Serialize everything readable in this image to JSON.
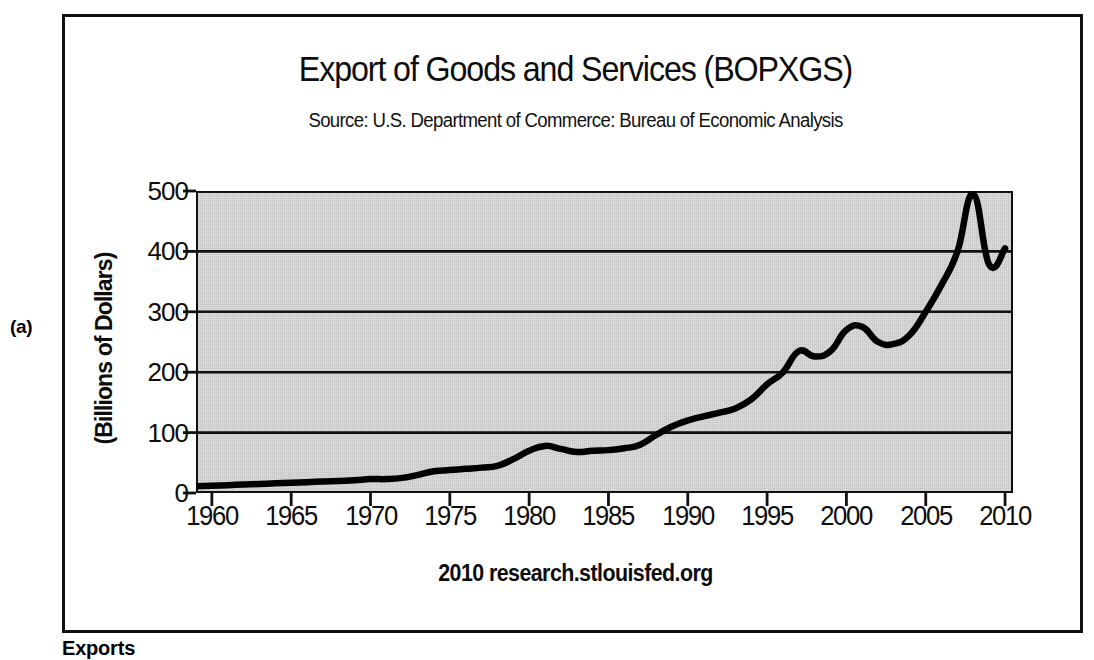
{
  "figure": {
    "panel_label": "(a)",
    "caption": "Exports"
  },
  "chart_data": {
    "type": "line",
    "title": "Export of Goods and Services (BOPXGS)",
    "subtitle": "Source: U.S. Department of Commerce: Bureau of Economic Analysis",
    "footer": "2010 research.stlouisfed.org",
    "xlabel": "",
    "ylabel": "(Billions of Dollars)",
    "xlim": [
      1959,
      2010.5
    ],
    "ylim": [
      0,
      500
    ],
    "xticks": [
      1960,
      1965,
      1970,
      1975,
      1980,
      1985,
      1990,
      1995,
      2000,
      2005,
      2010
    ],
    "yticks": [
      0,
      100,
      200,
      300,
      400,
      500
    ],
    "grid": "horizontal",
    "legend": "none",
    "plot_background": "#dedede",
    "line_color": "#000000",
    "series": [
      {
        "name": "Export of Goods and Services (BOPXGS)",
        "x": [
          1959,
          1960,
          1961,
          1962,
          1963,
          1964,
          1965,
          1966,
          1967,
          1968,
          1969,
          1970,
          1971,
          1972,
          1973,
          1974,
          1975,
          1976,
          1977,
          1978,
          1979,
          1980,
          1981,
          1982,
          1983,
          1984,
          1985,
          1986,
          1987,
          1988,
          1989,
          1990,
          1991,
          1992,
          1993,
          1994,
          1995,
          1996,
          1997,
          1998,
          1999,
          2000,
          2001,
          2002,
          2003,
          2004,
          2005,
          2006,
          2007,
          2008,
          2009,
          2010
        ],
        "values": [
          11,
          12,
          13,
          14,
          15,
          16,
          17,
          18,
          19,
          20,
          21,
          23,
          23,
          25,
          30,
          36,
          38,
          40,
          42,
          45,
          56,
          70,
          78,
          73,
          68,
          70,
          71,
          74,
          80,
          96,
          110,
          120,
          127,
          133,
          140,
          155,
          180,
          200,
          235,
          226,
          235,
          270,
          275,
          250,
          247,
          262,
          300,
          345,
          400,
          495,
          378,
          405
        ]
      }
    ]
  }
}
